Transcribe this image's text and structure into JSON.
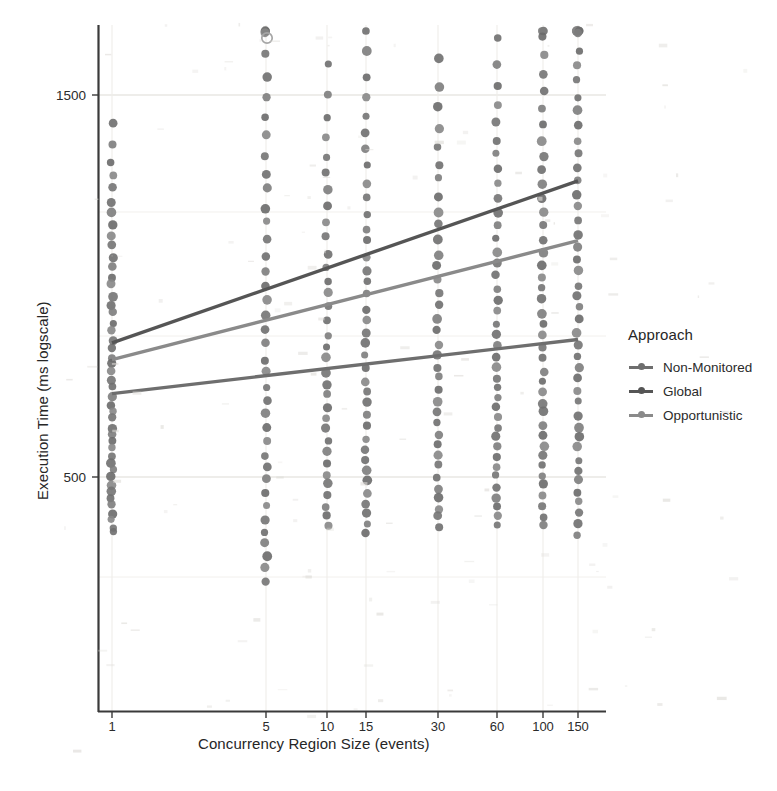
{
  "chart_data": {
    "type": "scatter",
    "title": "",
    "xlabel": "Concurrency Region Size (events)",
    "ylabel": "Execution Time (ms logscale)",
    "x_scale": "log",
    "y_scale": "log",
    "grid": true,
    "legend_position": "right",
    "legend_title": "Approach",
    "categories": [
      "1",
      "5",
      "10",
      "15",
      "30",
      "60",
      "100",
      "150"
    ],
    "x_tick_labels": [
      "1",
      "5",
      "10",
      "15",
      "30",
      "60",
      "100",
      "150"
    ],
    "y_tick_labels": [
      "500",
      "1500"
    ],
    "y_ticks": [
      500,
      1500
    ],
    "ylim": [
      150,
      2100
    ],
    "series": [
      {
        "name": "Non-Monitored",
        "color": "#6e6e6e",
        "trend_start": 1180,
        "trend_end": 1010,
        "values": [
          1180,
          1130,
          1100,
          1085,
          1060,
          1035,
          1020,
          1010
        ]
      },
      {
        "name": "Global",
        "color": "#555555",
        "trend_start": 1020,
        "trend_end": 640,
        "values": [
          1020,
          900,
          845,
          820,
          760,
          710,
          675,
          640
        ]
      },
      {
        "name": "Opportunistic",
        "color": "#8a8a8a",
        "trend_start": 1070,
        "trend_end": 760,
        "values": [
          1070,
          970,
          925,
          905,
          855,
          815,
          785,
          760
        ]
      }
    ],
    "annotations": [
      {
        "text": "open circle outlier near x=5 top of panel",
        "x": "5",
        "y": 2050
      }
    ],
    "scatter_columns": [
      {
        "category": "1",
        "n_points": 46,
        "y_range": [
          520,
          1780
        ]
      },
      {
        "category": "5",
        "n_points": 40,
        "y_range": [
          300,
          2050
        ]
      },
      {
        "category": "10",
        "n_points": 34,
        "y_range": [
          430,
          1760
        ]
      },
      {
        "category": "15",
        "n_points": 38,
        "y_range": [
          380,
          1790
        ]
      },
      {
        "category": "30",
        "n_points": 36,
        "y_range": [
          420,
          1760
        ]
      },
      {
        "category": "60",
        "n_points": 40,
        "y_range": [
          400,
          1740
        ]
      },
      {
        "category": "100",
        "n_points": 42,
        "y_range": [
          340,
          1750
        ]
      },
      {
        "category": "150",
        "n_points": 52,
        "y_range": [
          200,
          1800
        ]
      }
    ]
  },
  "legend": {
    "title": "Approach",
    "items": [
      {
        "label": "Non-Monitored",
        "color": "#6e6e6e"
      },
      {
        "label": "Global",
        "color": "#555555"
      },
      {
        "label": "Opportunistic",
        "color": "#8a8a8a"
      }
    ]
  },
  "axes": {
    "x_title": "Concurrency Region Size (events)",
    "y_title": "Execution Time (ms logscale)",
    "y_ticks": [
      {
        "label": "1500",
        "y_px": 95
      },
      {
        "label": "500",
        "y_px": 477
      }
    ],
    "x_ticks": [
      {
        "label": "1",
        "x_px": 112
      },
      {
        "label": "5",
        "x_px": 266
      },
      {
        "label": "10",
        "x_px": 327
      },
      {
        "label": "15",
        "x_px": 366
      },
      {
        "label": "30",
        "x_px": 438
      },
      {
        "label": "60",
        "x_px": 497
      },
      {
        "label": "100",
        "x_px": 543
      },
      {
        "label": "150",
        "x_px": 578
      }
    ]
  },
  "colors": {
    "background": "#ffffff",
    "axis": "#3a3a3a",
    "grid": "#e9e7e3",
    "point": "#767676",
    "text": "#2b2b2b"
  }
}
